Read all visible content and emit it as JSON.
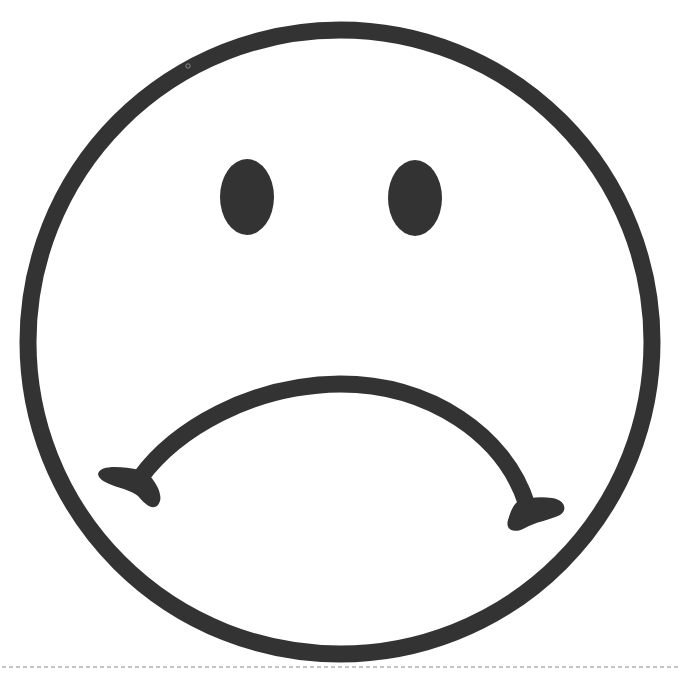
{
  "figure": {
    "colors": {
      "background": "#ffffff",
      "ink": "#333333",
      "dashed_rule": "#8a8a8a"
    },
    "face": {
      "cx": 340,
      "cy": 342,
      "r": 312,
      "stroke_width": 17
    },
    "eyes": [
      {
        "name": "left-eye",
        "cx": 247,
        "cy": 197,
        "rx": 27,
        "ry": 38
      },
      {
        "name": "right-eye",
        "cx": 415,
        "cy": 198,
        "rx": 27,
        "ry": 38
      }
    ],
    "mouth": {
      "shape": "frown",
      "stroke_width": 17
    },
    "dashed_rule": {
      "y": 667,
      "x1": 2,
      "x2": 681
    }
  }
}
